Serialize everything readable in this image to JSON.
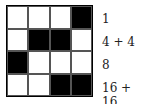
{
  "grid": {
    "rows": [
      [
        0,
        0,
        0,
        1
      ],
      [
        0,
        1,
        1,
        0
      ],
      [
        1,
        0,
        0,
        0
      ],
      [
        0,
        0,
        1,
        1
      ]
    ]
  },
  "labels": [
    "1",
    "4 + 4",
    "8",
    "16 + 16"
  ],
  "colors": {
    "filled": "#000000",
    "empty": "#ffffff"
  }
}
